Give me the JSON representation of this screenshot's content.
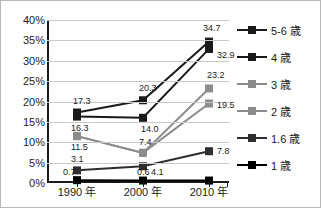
{
  "chart_data": {
    "type": "line",
    "title": "",
    "subtitle": "",
    "xlabel": "",
    "ylabel": "",
    "categories": [
      "1990 年",
      "2000 年",
      "2010 年"
    ],
    "ylim": [
      0,
      40
    ],
    "ytick_labels": [
      "0%",
      "5%",
      "10%",
      "15%",
      "20%",
      "25%",
      "30%",
      "35%",
      "40%"
    ],
    "ytick_values": [
      0,
      5,
      10,
      15,
      20,
      25,
      30,
      35,
      40
    ],
    "grid": true,
    "legend_position": "right",
    "series": [
      {
        "name": "5-6 歳",
        "color": "#1a1a1a",
        "values": [
          17.3,
          20.3,
          34.7
        ],
        "labels": [
          "17.3",
          "20.3",
          "34.7"
        ]
      },
      {
        "name": "4 歳",
        "color": "#1a1a1a",
        "values": [
          16.3,
          16.0,
          32.9
        ],
        "labels": [
          "16.3",
          "14.0",
          "32.9"
        ]
      },
      {
        "name": "3 歳",
        "color": "#8c8c8c",
        "values": [
          11.5,
          7.4,
          23.2
        ],
        "labels": [
          "11.5",
          "7.4",
          "23.2"
        ]
      },
      {
        "name": "2 歳",
        "color": "#8c8c8c",
        "values": [
          11.5,
          7.4,
          19.5
        ],
        "labels": [
          "",
          "",
          "19.5"
        ]
      },
      {
        "name": "1.6 歳",
        "color": "#2e2e2e",
        "values": [
          3.1,
          4.1,
          7.8
        ],
        "labels": [
          "3.1",
          "4.1",
          "7.8"
        ]
      },
      {
        "name": "1 歳",
        "color": "#000000",
        "values": [
          0.7,
          0.6,
          0.6
        ],
        "labels": [
          "0.7",
          "0.6",
          ""
        ]
      }
    ]
  },
  "legend": {
    "items": [
      {
        "label": "5-6 歳",
        "color": "#1a1a1a"
      },
      {
        "label": "4 歳",
        "color": "#1a1a1a"
      },
      {
        "label": "3 歳",
        "color": "#8c8c8c"
      },
      {
        "label": "2 歳",
        "color": "#8c8c8c"
      },
      {
        "label": "1.6 歳",
        "color": "#2e2e2e"
      },
      {
        "label": "1 歳",
        "color": "#000000"
      }
    ]
  }
}
